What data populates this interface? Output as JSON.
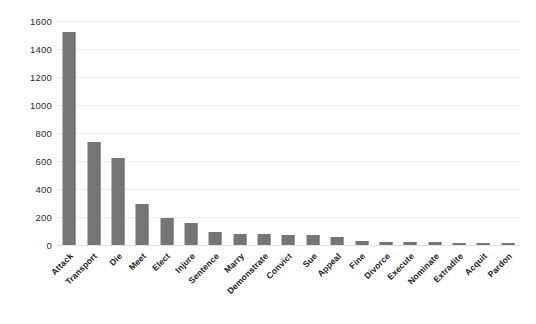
{
  "chart_data": {
    "type": "bar",
    "title": "",
    "subtitle": "",
    "xlabel": "",
    "ylabel": "",
    "ylim": [
      0,
      1600
    ],
    "ytick_step": 200,
    "yticks": [
      0,
      200,
      400,
      600,
      800,
      1000,
      1200,
      1400,
      1600
    ],
    "ytick_labels": [
      "0",
      "200",
      "400",
      "600",
      "800",
      "1000",
      "1200",
      "1400",
      "1600"
    ],
    "grid": true,
    "grid_axis": "y",
    "legend": false,
    "legend_position": "none",
    "bar_color": "#767676",
    "grid_color": "#ededed",
    "background_color": "#fefefe",
    "xtick_rotation": -45,
    "categories": [
      "Attack",
      "Transport",
      "Die",
      "Meet",
      "Elect",
      "Injure",
      "Sentence",
      "Marry",
      "Demonstrate",
      "Convict",
      "Sue",
      "Appeal",
      "Fine",
      "Divorce",
      "Execute",
      "Nominate",
      "Extradite",
      "Acquit",
      "Pardon"
    ],
    "values": [
      1520,
      735,
      620,
      290,
      190,
      155,
      95,
      80,
      78,
      72,
      68,
      55,
      30,
      25,
      22,
      18,
      15,
      12,
      8
    ],
    "series": [
      {
        "name": "Event count",
        "values": [
          1520,
          735,
          620,
          290,
          190,
          155,
          95,
          80,
          78,
          72,
          68,
          55,
          30,
          25,
          22,
          18,
          15,
          12,
          8
        ]
      }
    ]
  }
}
